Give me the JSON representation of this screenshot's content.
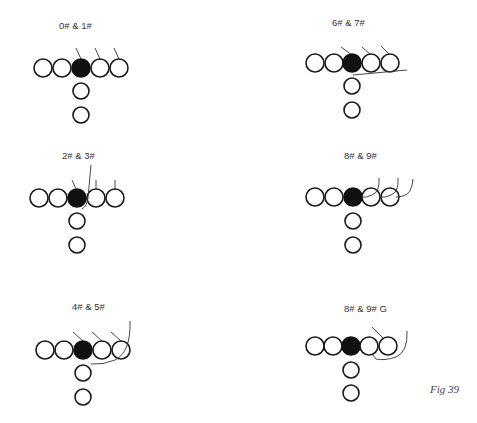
{
  "figure": {
    "label": "Fig 39",
    "diagrams": [
      {
        "title": "0# & 1#"
      },
      {
        "title": "6# & 7#"
      },
      {
        "title": "2# & 3#"
      },
      {
        "title": "8# & 9#"
      },
      {
        "title": "4# & 5#"
      },
      {
        "title": "8# & 9# G"
      }
    ]
  },
  "colors": {
    "outline": "#1a1a1a",
    "filled": "#111111",
    "line": "#333333",
    "background": "#ffffff"
  }
}
